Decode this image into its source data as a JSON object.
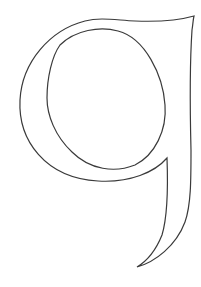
{
  "figure": {
    "glyph": "q",
    "stroke_color": "#3a3a3a",
    "fill_color": "#ffffff",
    "background": "#ffffff"
  }
}
